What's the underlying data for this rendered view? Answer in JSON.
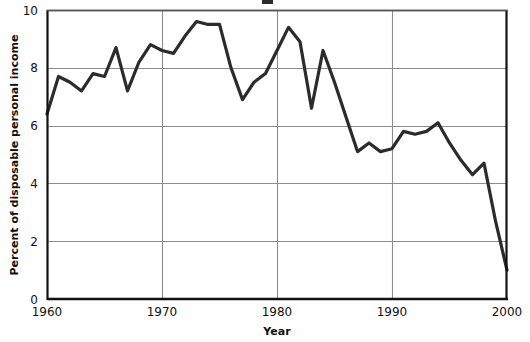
{
  "chart_data": {
    "type": "line",
    "title": "",
    "xlabel": "Year",
    "ylabel": "Percent of disposable personal income",
    "xlim": [
      1960,
      2000
    ],
    "ylim": [
      0,
      10
    ],
    "ytick_values": [
      0,
      2,
      4,
      6,
      8,
      10
    ],
    "ytick_labels": [
      "0",
      "2",
      "4",
      "6",
      "8",
      "10"
    ],
    "xtick_values": [
      1960,
      1970,
      1980,
      1990,
      2000
    ],
    "xtick_labels": [
      "1960",
      "1970",
      "1980",
      "1990",
      "2000"
    ],
    "grid": "horizontal-and-vertical-at-ticks",
    "legend": "none",
    "line_color": "#2b2b2b",
    "grid_color": "#8c8c8c",
    "axis_color": "#111111",
    "background": "#ffffff",
    "series": [
      {
        "name": "Personal saving rate",
        "x": [
          1960,
          1961,
          1962,
          1963,
          1964,
          1965,
          1966,
          1967,
          1968,
          1969,
          1970,
          1971,
          1972,
          1973,
          1974,
          1975,
          1976,
          1977,
          1978,
          1979,
          1980,
          1981,
          1982,
          1983,
          1984,
          1985,
          1986,
          1987,
          1988,
          1989,
          1990,
          1991,
          1992,
          1993,
          1994,
          1995,
          1996,
          1997,
          1998,
          1999,
          2000
        ],
        "values": [
          6.4,
          7.7,
          7.5,
          7.2,
          7.8,
          7.7,
          8.7,
          7.2,
          8.2,
          8.8,
          8.6,
          8.5,
          9.1,
          9.6,
          9.5,
          9.5,
          8.0,
          6.9,
          7.5,
          7.8,
          8.6,
          9.4,
          8.9,
          6.6,
          8.6,
          7.5,
          6.3,
          5.1,
          5.4,
          5.1,
          5.2,
          5.8,
          5.7,
          5.8,
          6.1,
          5.4,
          4.8,
          4.3,
          4.7,
          2.7,
          1.0
        ]
      }
    ]
  },
  "axes": {
    "ylabel_text": "Percent of disposable personal income",
    "xlabel_text": "Year"
  },
  "figure": {
    "title_fragment": ""
  }
}
